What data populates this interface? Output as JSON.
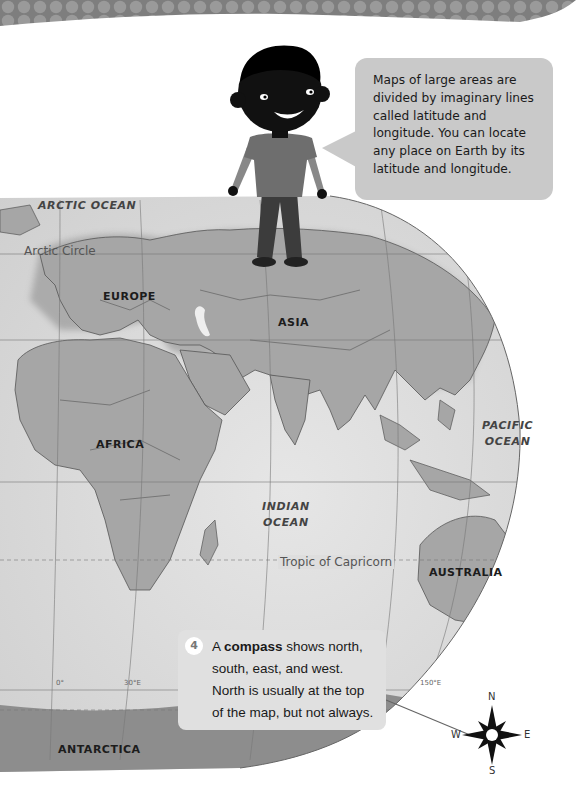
{
  "speech_bubble": {
    "text": "Maps of large areas are divided by imaginary lines called latitude and longitude. You can locate any place on Earth by its latitude and longitude."
  },
  "map": {
    "continents": [
      {
        "name": "EUROPE",
        "x": 103,
        "y": 290
      },
      {
        "name": "ASIA",
        "x": 278,
        "y": 316
      },
      {
        "name": "AFRICA",
        "x": 96,
        "y": 438
      },
      {
        "name": "AUSTRALIA",
        "x": 429,
        "y": 566
      },
      {
        "name": "ANTARCTICA",
        "x": 58,
        "y": 743
      }
    ],
    "oceans": [
      {
        "line1": "ARCTIC OCEAN",
        "line2": "",
        "x": 38,
        "y": 200
      },
      {
        "line1": "PACIFIC",
        "line2": "OCEAN",
        "x": 482,
        "y": 418
      },
      {
        "line1": "INDIAN",
        "line2": "OCEAN",
        "x": 262,
        "y": 499
      }
    ],
    "lines": [
      {
        "name": "Arctic Circle",
        "x": 24,
        "y": 244
      },
      {
        "name": "Tropic of  Capricorn",
        "x": 278,
        "y": 555
      }
    ],
    "longitude_labels": [
      {
        "text": "0°",
        "x": 56,
        "y": 679
      },
      {
        "text": "30°E",
        "x": 124,
        "y": 679
      },
      {
        "text": "150°E",
        "x": 420,
        "y": 679
      }
    ]
  },
  "info_box": {
    "step_number": "4",
    "text_before": "A ",
    "text_bold": "compass",
    "text_after": " shows north, south, east, and west. North is usually at the top of the map, but not always."
  },
  "compass": {
    "north": "N",
    "south": "S",
    "east": "E",
    "west": "W"
  },
  "colors": {
    "land": "#a6a6a6",
    "ocean": "#dcdcdc",
    "border": "#555555",
    "bubble": "#c9c9c9",
    "banner": "#8a8a8a"
  }
}
